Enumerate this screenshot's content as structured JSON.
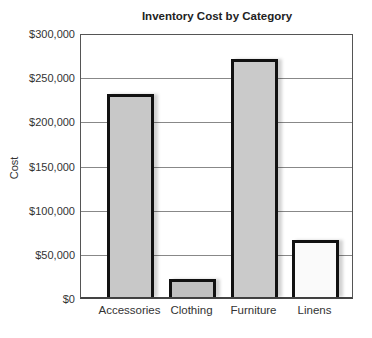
{
  "chart_data": {
    "type": "bar",
    "title": "Inventory Cost by Category",
    "xlabel": "",
    "ylabel": "Cost",
    "categories": [
      "Accessories",
      "Clothing",
      "Furniture",
      "Linens"
    ],
    "values": [
      230000,
      20000,
      270000,
      65000
    ],
    "ylim": [
      0,
      300000
    ],
    "yticks": [
      "$0",
      "$50,000",
      "$100,000",
      "$150,000",
      "$200,000",
      "$250,000",
      "$300,000"
    ],
    "grid": true,
    "legend": null,
    "bar_colors": [
      "#c8c8c8",
      "#c0c0c0",
      "#cacaca",
      "#fafafa"
    ]
  }
}
